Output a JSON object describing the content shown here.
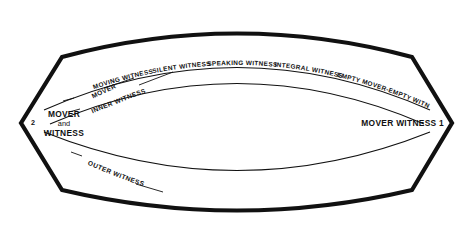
{
  "diagram": {
    "background_color": "#ffffff",
    "line_color": "#111111",
    "vertices": {
      "left": {
        "number": "2",
        "line1": "MOVER",
        "line2": "and",
        "line3": "WITNESS"
      },
      "right": {
        "label": "MOVER WITNESS 1"
      }
    },
    "upper_arc_labels": [
      {
        "id": "moving-witness",
        "text": "MOVING WITNESS"
      },
      {
        "id": "silent-witness",
        "text": "SILENT WITNESS"
      },
      {
        "id": "speaking-witness",
        "text": "SPEAKING WITNESS"
      },
      {
        "id": "integral-witness",
        "text": "INTEGRAL WITNESS"
      },
      {
        "id": "empty-mover-empty-witness",
        "text": "EMPTY MOVER-EMPTY WITNESS"
      }
    ],
    "leader_labels": [
      {
        "id": "mover",
        "text": "MOVER"
      },
      {
        "id": "inner-witness",
        "text": "INNER WITNESS"
      },
      {
        "id": "outer-witness",
        "text": "OUTER WITNESS"
      }
    ]
  }
}
